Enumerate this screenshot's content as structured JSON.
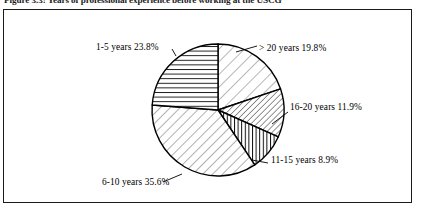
{
  "figure": {
    "caption": "Figure 3.3: Years of professional experience before working at the USCG"
  },
  "chart_data": {
    "type": "pie",
    "title": "Figure 3.3: Years of professional experience before working at the USCG",
    "xlabel": "",
    "ylabel": "",
    "legend_position": "none",
    "grid": false,
    "labels": [
      "> 20 years",
      "16-20 years",
      "11-15 years",
      "6-10 years",
      "1-5 years"
    ],
    "values": [
      19.8,
      11.9,
      8.9,
      35.6,
      23.8
    ],
    "units": "%",
    "start_angle_deg": 0,
    "direction": "clockwise",
    "slices": [
      {
        "label": "> 20 years",
        "value": 19.8,
        "label_text": "> 20 years 19.8%",
        "pattern": "diagonal-light-forward",
        "fill": "#ffffff",
        "stroke": "#000000"
      },
      {
        "label": "16-20 years",
        "value": 11.9,
        "label_text": "16-20 years 11.9%",
        "pattern": "diagonal-dense-forward",
        "fill": "#ffffff",
        "stroke": "#000000"
      },
      {
        "label": "11-15 years",
        "value": 8.9,
        "label_text": "11-15 years 8.9%",
        "pattern": "vertical-lines",
        "fill": "#ffffff",
        "stroke": "#000000"
      },
      {
        "label": "6-10 years",
        "value": 35.6,
        "label_text": "6-10 years 35.6%",
        "pattern": "diagonal-wide-backward",
        "fill": "#ffffff",
        "stroke": "#000000"
      },
      {
        "label": "1-5 years",
        "value": 23.8,
        "label_text": "1-5 years 23.8%",
        "pattern": "horizontal-lines",
        "fill": "#ffffff",
        "stroke": "#000000"
      }
    ]
  },
  "colors": {
    "frame_border": "#1a1a1a",
    "slice_outline": "#000000",
    "hatch": "#000000",
    "background": "#ffffff",
    "text": "#000000"
  }
}
